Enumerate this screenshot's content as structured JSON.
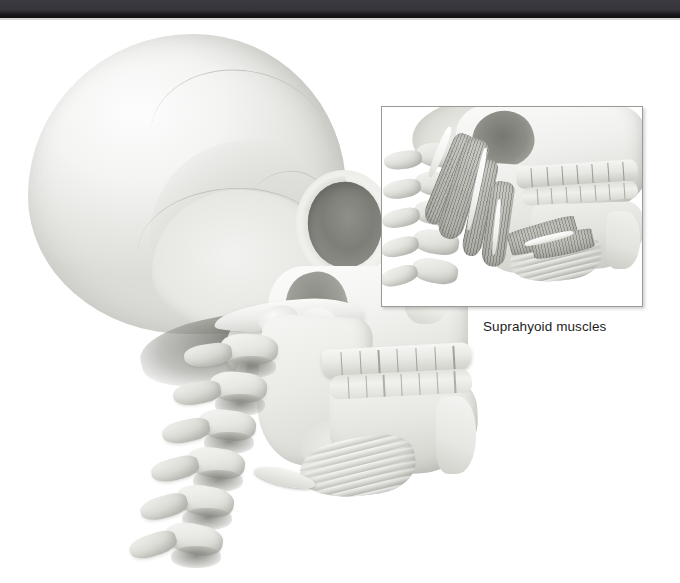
{
  "page": {
    "width": 680,
    "height": 583,
    "background_color": "#ffffff",
    "scan_bar_color": "#34343a"
  },
  "figure": {
    "main_illustration_name": "skull-lateral-illustration",
    "parts": [
      "cranium",
      "orbit",
      "zygomatic-arch",
      "maxilla",
      "upper-teeth",
      "lower-teeth",
      "mandible",
      "hyoid-bone",
      "larynx",
      "cervical-vertebrae"
    ],
    "tooth_count_upper": 8,
    "tooth_count_lower": 8,
    "vertebra_count": 6,
    "bone_tint": "#e9e9e7",
    "shadow_tint": "#8f8f89"
  },
  "inset": {
    "name": "suprahyoid-muscles-inset",
    "caption": "Suprahyoid muscles",
    "border_color": "#9b9b95",
    "background_color": "#ffffff",
    "x": 381,
    "y": 86,
    "width": 260,
    "height": 199,
    "tooth_count_upper": 8,
    "tooth_count_lower": 8,
    "vertebra_count": 5,
    "muscle_tint": "#b0b0aa",
    "tendon_tint": "#ffffff"
  },
  "caption": {
    "text": "Suprahyoid muscles",
    "color": "#1d1d1d",
    "x": 483,
    "y": 299
  }
}
